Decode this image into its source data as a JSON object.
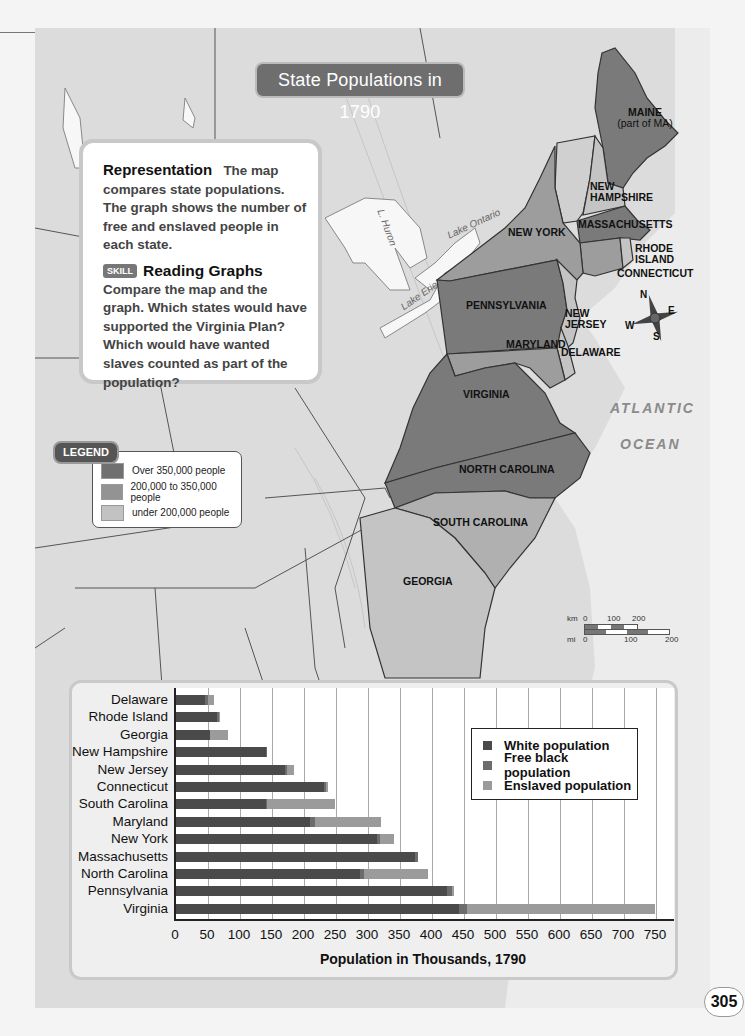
{
  "map": {
    "title": "State Populations in 1790",
    "info_box": {
      "heading": "Representation",
      "text": "The map compares state populations. The graph shows the number of free and enslaved people in each state.",
      "skill_badge": "SKILL",
      "skill_title": "Reading Graphs",
      "skill_text": "Compare the map and the graph. Which states would have supported the Virginia Plan? Which would have wanted slaves counted as part of the population?"
    },
    "legend": {
      "title": "LEGEND",
      "items": [
        {
          "label": "Over 350,000 people",
          "color": "#707070"
        },
        {
          "label": "200,000 to 350,000 people",
          "color": "#939393"
        },
        {
          "label": "under 200,000 people",
          "color": "#c2c2c2"
        }
      ]
    },
    "state_labels": {
      "maine": "MAINE",
      "maine_sub": "(part of MA)",
      "new_hampshire": "NEW HAMPSHIRE",
      "massachusetts": "MASSACHUSETTS",
      "rhode_island": "RHODE ISLAND",
      "connecticut": "CONNECTICUT",
      "new_york": "NEW YORK",
      "pennsylvania": "PENNSYLVANIA",
      "new_jersey": "NEW JERSEY",
      "maryland": "MARYLAND",
      "delaware": "DELAWARE",
      "virginia": "VIRGINIA",
      "north_carolina": "NORTH CAROLINA",
      "south_carolina": "SOUTH CAROLINA",
      "georgia": "GEORGIA"
    },
    "water_labels": {
      "atlantic": "ATLANTIC",
      "ocean": "OCEAN",
      "lake_huron": "L. Huron",
      "lake_ontario": "Lake Ontario",
      "lake_erie": "Lake Erie"
    },
    "compass": {
      "n": "N",
      "e": "E",
      "s": "S",
      "w": "W"
    },
    "scale_bar": {
      "km_label": "km",
      "km_ticks": [
        "0",
        "100",
        "200"
      ],
      "mi_label": "mi",
      "mi_ticks": [
        "0",
        "100",
        "200"
      ]
    }
  },
  "page_number": "305",
  "chart_data": {
    "type": "bar",
    "orientation": "horizontal",
    "stacked": true,
    "title": "",
    "xlabel": "Population in Thousands, 1790",
    "ylabel": "",
    "xlim": [
      0,
      750
    ],
    "xticks": [
      "0",
      "50",
      "100",
      "150",
      "200",
      "250",
      "300",
      "350",
      "400",
      "450",
      "500",
      "550",
      "600",
      "650",
      "700",
      "750"
    ],
    "grid": true,
    "legend_position": "upper right (inside plot)",
    "categories": [
      "Delaware",
      "Rhode Island",
      "Georgia",
      "New Hampshire",
      "New Jersey",
      "Connecticut",
      "South Carolina",
      "Maryland",
      "New York",
      "Massachusetts",
      "North Carolina",
      "Pennsylvania",
      "Virginia"
    ],
    "series": [
      {
        "name": "White population",
        "color": "#4a4a4a",
        "values": [
          46,
          64,
          53,
          141,
          170,
          232,
          140,
          209,
          314,
          373,
          288,
          424,
          442
        ]
      },
      {
        "name": "Free black population",
        "color": "#6c6c6c",
        "values": [
          4,
          3,
          0,
          1,
          3,
          3,
          2,
          8,
          5,
          5,
          5,
          7,
          13
        ]
      },
      {
        "name": "Enslaved population",
        "color": "#9b9b9b",
        "values": [
          9,
          1,
          29,
          0,
          11,
          3,
          107,
          103,
          21,
          0,
          101,
          4,
          293
        ]
      }
    ]
  }
}
